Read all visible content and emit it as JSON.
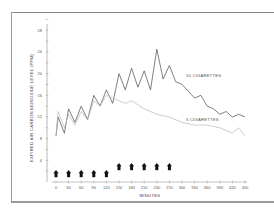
{
  "chart_data": {
    "type": "line",
    "title": "",
    "xlabel": "MINUTES",
    "ylabel": "EXPIRED AIR CARBON MONOXIDE LEVEL (PPM)",
    "xlim": [
      0,
      450
    ],
    "ylim": [
      0,
      30
    ],
    "x_ticks": [
      0,
      30,
      60,
      90,
      120,
      150,
      180,
      210,
      240,
      270,
      300,
      330,
      360,
      390,
      420,
      450
    ],
    "y_ticks": [
      4,
      8,
      12,
      16,
      20,
      24,
      28
    ],
    "grid": false,
    "series": [
      {
        "name": "10 CIGARETTES",
        "color": "#555555",
        "x": [
          0,
          5,
          20,
          30,
          45,
          60,
          75,
          90,
          105,
          120,
          135,
          150,
          165,
          180,
          195,
          210,
          225,
          240,
          255,
          270,
          285,
          300,
          330,
          345,
          360,
          375,
          390,
          405,
          420,
          435,
          450
        ],
        "values": [
          8.5,
          12,
          9,
          13.5,
          11,
          14,
          11.5,
          16,
          14,
          17,
          14.5,
          20,
          17,
          21,
          17.5,
          20.5,
          17,
          24.5,
          19,
          21.5,
          18.5,
          18,
          15.5,
          16,
          14,
          13.5,
          12.5,
          13,
          12,
          12.5,
          12
        ]
      },
      {
        "name": "5 CIGARETTES",
        "color": "#b8b8b8",
        "x": [
          0,
          5,
          20,
          30,
          45,
          60,
          75,
          90,
          105,
          120,
          135,
          150,
          165,
          180,
          210,
          240,
          270,
          300,
          330,
          360,
          390,
          420,
          435,
          450
        ],
        "values": [
          8.5,
          13,
          10,
          12.5,
          10.5,
          13,
          11.5,
          15,
          14,
          16,
          15.5,
          15,
          14.5,
          15,
          13.5,
          12.5,
          12,
          11,
          10.5,
          10.5,
          10,
          9,
          10,
          8.5
        ]
      }
    ],
    "annotations": {
      "cigarette_markers_low": [
        0,
        30,
        60,
        90,
        120
      ],
      "cigarette_markers_high": [
        150,
        180,
        210,
        240,
        270
      ],
      "marker_glyph": "upward-arrow"
    },
    "legend_position": "inline-labels"
  },
  "labels": {
    "series_10": "10 CIGARETTES",
    "series_5": "5 CIGARETTES",
    "xlabel": "MINUTES",
    "ylabel": "EXPIRED AIR CARBON MONOXIDE LEVEL (PPM)",
    "x_ticks": [
      "0",
      "30",
      "60",
      "90",
      "120",
      "150",
      "180",
      "210",
      "240",
      "270",
      "300",
      "330",
      "360",
      "390",
      "420",
      "450"
    ],
    "y_ticks": [
      "4",
      "8",
      "12",
      "16",
      "20",
      "24",
      "28"
    ]
  }
}
